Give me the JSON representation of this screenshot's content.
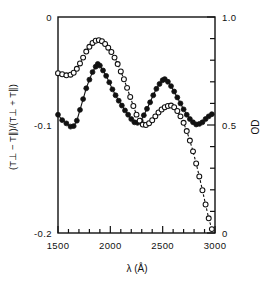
{
  "figure": {
    "name": "linear-dichroism-spectrum",
    "background": "#ffffff",
    "ink": "#111111"
  },
  "chart_data": {
    "type": "line",
    "title": "",
    "subtitle": "",
    "xlabel": "λ (Å)",
    "ylabel": "(T⊥ − T∥)/(T⊥ + T∥)",
    "y2label": "OD",
    "xlim": [
      1500,
      3000
    ],
    "ylim": [
      0,
      -0.2
    ],
    "y2lim": [
      0,
      1.0
    ],
    "grid": false,
    "legend": "none",
    "y_axis_inverted": true,
    "x_ticks_major": [
      1500,
      2000,
      2500,
      3000
    ],
    "x_ticks_major_labels": [
      "1500",
      "2000",
      "2500",
      "3000"
    ],
    "x_tick_minor_step": 100,
    "y_ticks_major": [
      -0.2,
      -0.1,
      0
    ],
    "y_ticks_major_labels": [
      "-0.2",
      "-0.1",
      "0"
    ],
    "y_tick_minor_step": 0.02,
    "y2_ticks_major": [
      1.0,
      0.5,
      0
    ],
    "y2_ticks_major_labels": [
      "1.0",
      "0.5",
      "0"
    ],
    "y2_tick_minor_step": 0.1,
    "series": [
      {
        "name": "linear-dichroism",
        "marker": "filled-circle",
        "line": "solid",
        "color": "#111111",
        "axis": "left",
        "x": [
          1500,
          1540,
          1580,
          1620,
          1650,
          1680,
          1710,
          1740,
          1770,
          1800,
          1830,
          1860,
          1880,
          1900,
          1930,
          1960,
          1990,
          2020,
          2050,
          2080,
          2110,
          2140,
          2170,
          2200,
          2230,
          2260,
          2290,
          2320,
          2350,
          2380,
          2410,
          2440,
          2470,
          2500,
          2520,
          2550,
          2580,
          2610,
          2640,
          2670,
          2700,
          2730,
          2760,
          2790,
          2820,
          2850,
          2880,
          2910,
          2940,
          2970
        ],
        "y": [
          -0.0905,
          -0.0955,
          -0.0985,
          -0.1015,
          -0.101,
          -0.096,
          -0.086,
          -0.076,
          -0.066,
          -0.058,
          -0.051,
          -0.046,
          -0.0435,
          -0.045,
          -0.0495,
          -0.0545,
          -0.0605,
          -0.067,
          -0.0725,
          -0.0775,
          -0.082,
          -0.0865,
          -0.0905,
          -0.0945,
          -0.0975,
          -0.098,
          -0.096,
          -0.091,
          -0.085,
          -0.079,
          -0.0725,
          -0.0665,
          -0.062,
          -0.0585,
          -0.0575,
          -0.06,
          -0.064,
          -0.069,
          -0.0745,
          -0.08,
          -0.0855,
          -0.0905,
          -0.0945,
          -0.0975,
          -0.0995,
          -0.099,
          -0.0975,
          -0.0945,
          -0.092,
          -0.09
        ]
      },
      {
        "name": "optical-density",
        "marker": "open-circle",
        "line": "dashed",
        "color": "#111111",
        "axis": "right",
        "x": [
          1500,
          1540,
          1580,
          1620,
          1650,
          1680,
          1710,
          1740,
          1770,
          1800,
          1830,
          1860,
          1890,
          1920,
          1950,
          1980,
          2010,
          2040,
          2070,
          2100,
          2130,
          2160,
          2190,
          2220,
          2250,
          2280,
          2310,
          2340,
          2370,
          2400,
          2430,
          2460,
          2490,
          2520,
          2550,
          2580,
          2610,
          2640,
          2670,
          2700,
          2730,
          2760,
          2790,
          2820,
          2850,
          2880,
          2910,
          2940,
          2970
        ],
        "y2": [
          0.74,
          0.735,
          0.73,
          0.733,
          0.742,
          0.76,
          0.785,
          0.812,
          0.84,
          0.862,
          0.88,
          0.89,
          0.893,
          0.888,
          0.875,
          0.858,
          0.838,
          0.812,
          0.782,
          0.748,
          0.712,
          0.672,
          0.63,
          0.588,
          0.548,
          0.52,
          0.502,
          0.5,
          0.508,
          0.522,
          0.54,
          0.558,
          0.572,
          0.582,
          0.588,
          0.59,
          0.582,
          0.565,
          0.54,
          0.51,
          0.472,
          0.428,
          0.378,
          0.322,
          0.262,
          0.198,
          0.132,
          0.068,
          0.018
        ]
      }
    ]
  }
}
